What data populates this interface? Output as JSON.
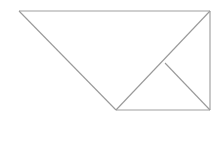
{
  "figure": {
    "canvas": {
      "width": 223,
      "height": 150,
      "background_color": "#ffffff"
    },
    "style": {
      "stroke_color": "#9a9a9a",
      "stroke_color_light": "#a8a8a8",
      "stroke_width": 1.1,
      "fill": "none"
    },
    "vertices": {
      "top_left": {
        "label": "A",
        "x": 19,
        "y": 11
      },
      "top_right": {
        "label": "B",
        "x": 210,
        "y": 11
      },
      "bottom_right": {
        "label": "C",
        "x": 210,
        "y": 110
      },
      "bottom_apex": {
        "label": "D",
        "x": 116,
        "y": 110
      },
      "inner_junction": {
        "label": "E",
        "x": 165,
        "y": 63
      }
    },
    "segments": [
      {
        "name": "top-edge",
        "from": "A",
        "to": "B",
        "points": "19,11 210,11",
        "role": "outline",
        "stroke": "#a0a0a0"
      },
      {
        "name": "right-edge",
        "from": "B",
        "to": "C",
        "points": "210,11 210,110",
        "role": "outline",
        "stroke": "#9a9a9a"
      },
      {
        "name": "bottom-edge",
        "from": "C",
        "to": "D",
        "points": "210,110 116,110",
        "role": "outline",
        "stroke": "#a0a0a0"
      },
      {
        "name": "left-diagonal-edge",
        "from": "D",
        "to": "A",
        "points": "116,110 19,11",
        "role": "outline",
        "stroke": "#9a9a9a"
      },
      {
        "name": "main-diagonal",
        "from": "D",
        "to": "B",
        "points": "116,110 210,11",
        "role": "interior-diagonal",
        "stroke": "#9a9a9a"
      },
      {
        "name": "short-diagonal",
        "from": "E",
        "to": "C",
        "points": "165,63 210,110",
        "role": "interior-diagonal",
        "stroke": "#9a9a9a"
      }
    ]
  }
}
